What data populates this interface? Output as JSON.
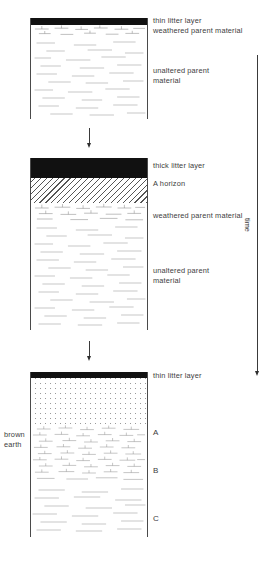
{
  "diagram": {
    "axis": {
      "label": "time",
      "direction": "downward"
    },
    "side_label": "brown\nearth"
  },
  "panels": [
    {
      "id": "stage-1",
      "name": "young-soil-profile",
      "labels": [
        {
          "key": "litter",
          "text": "thin litter layer"
        },
        {
          "key": "weathered",
          "text": "weathered parent material"
        },
        {
          "key": "unaltered",
          "text": "unaltered parent\nmaterial"
        }
      ],
      "horizons": [
        {
          "key": "litter",
          "text": "thin litter layer",
          "fill": "black-litter"
        },
        {
          "key": "weathered",
          "text": "weathered parent material",
          "fill": "tick-marks"
        },
        {
          "key": "unaltered",
          "text": "unaltered parent material",
          "fill": "dashes"
        }
      ]
    },
    {
      "id": "stage-2",
      "name": "developing-soil-profile",
      "labels": [
        {
          "key": "litter",
          "text": "thick litter layer"
        },
        {
          "key": "a-horizon",
          "text": "A horizon"
        },
        {
          "key": "weathered",
          "text": "weathered parent material"
        },
        {
          "key": "unaltered",
          "text": "unaltered parent\nmaterial"
        }
      ],
      "horizons": [
        {
          "key": "litter",
          "text": "thick litter layer",
          "fill": "black-litter"
        },
        {
          "key": "a-horizon",
          "text": "A horizon",
          "fill": "diagonal-hatch"
        },
        {
          "key": "weathered",
          "text": "weathered parent material",
          "fill": "tick-marks"
        },
        {
          "key": "unaltered",
          "text": "unaltered parent material",
          "fill": "dashes"
        }
      ]
    },
    {
      "id": "stage-3",
      "name": "mature-soil-profile",
      "labels": [
        {
          "key": "litter",
          "text": "thin litter layer"
        },
        {
          "key": "a-horizon",
          "text": "A"
        },
        {
          "key": "b-horizon",
          "text": "B"
        },
        {
          "key": "c-horizon",
          "text": "C"
        }
      ],
      "horizons": [
        {
          "key": "litter",
          "text": "thin litter layer",
          "fill": "black-litter"
        },
        {
          "key": "a-horizon",
          "text": "A",
          "fill": "stipple"
        },
        {
          "key": "b-horizon",
          "text": "B",
          "fill": "dense-tick-marks"
        },
        {
          "key": "c-horizon",
          "text": "C",
          "fill": "dashes"
        }
      ],
      "side_label": "brown\nearth"
    }
  ],
  "connectors": [
    {
      "key": "arrow-1-2",
      "text": "",
      "from": "stage-1",
      "to": "stage-2"
    },
    {
      "key": "arrow-2-3",
      "text": "",
      "from": "stage-2",
      "to": "stage-3"
    }
  ],
  "colors": {
    "litter": "#111111",
    "outline": "#4a4a4a",
    "text": "#3d3d3d",
    "texture": "#8c8c8c"
  }
}
